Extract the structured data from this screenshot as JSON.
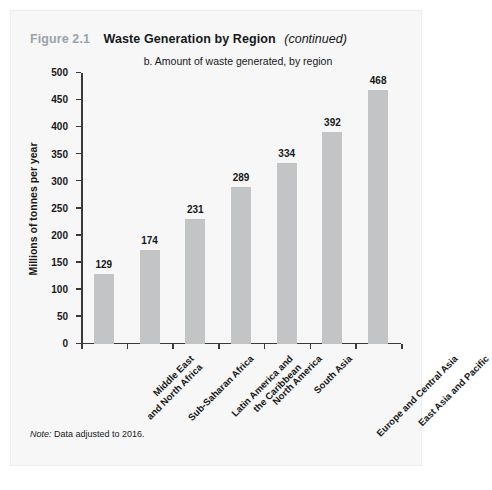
{
  "figure": {
    "number": "Figure 2.1",
    "title": "Waste Generation by Region",
    "continued": "(continued)",
    "note_label": "Note:",
    "note_text": " Data adjusted to 2016.",
    "number_color": "#9aa4a8",
    "bar_color": "#c3c4c6",
    "axis_color": "#3a3a3a",
    "panel_background": "#f7f7f7"
  },
  "chart_data": {
    "type": "bar",
    "title": "Waste Generation by Region (continued)",
    "subtitle": "b. Amount of waste generated, by region",
    "xlabel": "",
    "ylabel": "Millions of tonnes per year",
    "ylim": [
      0,
      500
    ],
    "ytick_step": 50,
    "yticks": [
      0,
      50,
      100,
      150,
      200,
      250,
      300,
      350,
      400,
      450,
      500
    ],
    "ytick_labels": [
      "0",
      "50",
      "100",
      "150",
      "200",
      "250",
      "300",
      "350",
      "400",
      "450",
      "500"
    ],
    "grid": false,
    "legend": "none",
    "categories": [
      "Middle East\nand North Africa",
      "Sub-Saharan Africa",
      "Latin America and\nthe Caribbean",
      "North America",
      "South Asia",
      "Europe and Central Asia",
      "East Asia and Pacific"
    ],
    "values": [
      129,
      174,
      231,
      289,
      334,
      392,
      468
    ],
    "data_labels": [
      "129",
      "174",
      "231",
      "289",
      "334",
      "392",
      "468"
    ],
    "series": [
      {
        "name": "Amount of waste generated",
        "values": [
          129,
          174,
          231,
          289,
          334,
          392,
          468
        ]
      }
    ]
  }
}
